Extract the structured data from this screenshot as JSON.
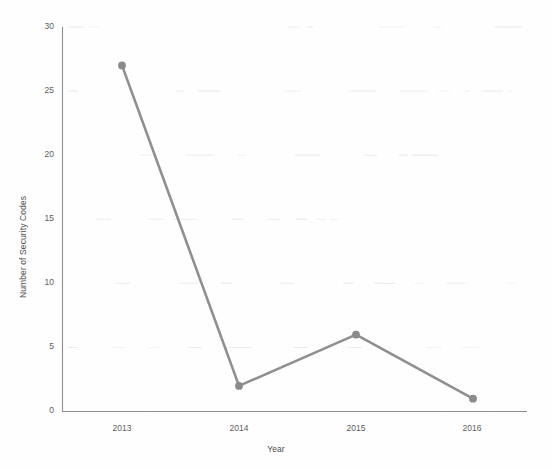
{
  "chart_data": {
    "type": "line",
    "title": "",
    "xlabel": "Year",
    "ylabel": "Number of Security Codes",
    "categories": [
      "2013",
      "2014",
      "2015",
      "2016"
    ],
    "values": [
      27,
      2,
      6,
      1
    ],
    "series": [
      {
        "name": "Number of Security Codes",
        "values": [
          27,
          2,
          6,
          1
        ]
      }
    ],
    "ylim": [
      0,
      30
    ],
    "ytick_labels": [
      "0",
      "5",
      "10",
      "15",
      "20",
      "25",
      "30"
    ],
    "ytick_values": [
      0,
      5,
      10,
      15,
      20,
      25,
      30
    ],
    "xtick_labels": [
      "2013",
      "2014",
      "2015",
      "2016"
    ],
    "grid": "faint-horizontal",
    "legend": "none",
    "line_color": "#8f8f8f",
    "marker_color": "#8a8a8a",
    "axis_color": "#8c8c8c",
    "background_color": "#ffffff"
  },
  "axes": {
    "y_title": "Number of Security Codes",
    "x_title": "Year"
  },
  "ticks": {
    "y": [
      {
        "label": "30",
        "value": 30
      },
      {
        "label": "25",
        "value": 25
      },
      {
        "label": "20",
        "value": 20
      },
      {
        "label": "15",
        "value": 15
      },
      {
        "label": "10",
        "value": 10
      },
      {
        "label": "5",
        "value": 5
      },
      {
        "label": "0",
        "value": 0
      }
    ],
    "x": [
      {
        "label": "2013",
        "value": 27
      },
      {
        "label": "2014",
        "value": 2
      },
      {
        "label": "2015",
        "value": 6
      },
      {
        "label": "2016",
        "value": 1
      }
    ]
  }
}
